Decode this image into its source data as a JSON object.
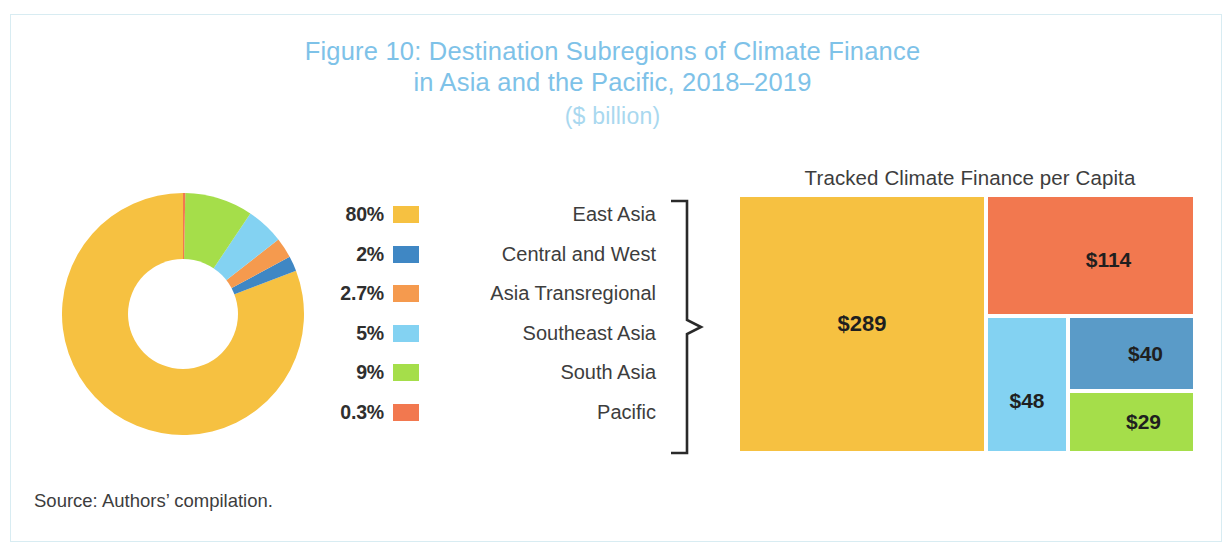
{
  "figure": {
    "title_line1": "Figure 10: Destination Subregions of Climate Finance",
    "title_line2": "in Asia and the Pacific, 2018–2019",
    "title_unit": "($ billion)",
    "source": "Source: Authors’ compilation."
  },
  "colors": {
    "title": "#7ec2e8",
    "title_unit": "#a9d8ef",
    "frame": "#d8ecf2",
    "east_asia": "#f6c141",
    "central_and_west": "#3f87c4",
    "asia_transregional": "#f59a4e",
    "southeast_asia": "#83d2f2",
    "south_asia": "#a5de4a",
    "pacific": "#f2784f",
    "brace": "#2a2a2a",
    "text": "#3d3d3d"
  },
  "legend": {
    "items": [
      {
        "pct": "80%",
        "label": "East Asia",
        "color": "#f6c141",
        "key": "east-asia"
      },
      {
        "pct": "2%",
        "label": "Central and West",
        "color": "#3f87c4",
        "key": "central-and-west"
      },
      {
        "pct": "2.7%",
        "label": "Asia Transregional",
        "color": "#f59a4e",
        "key": "asia-transregional"
      },
      {
        "pct": "5%",
        "label": "Southeast Asia",
        "color": "#83d2f2",
        "key": "southeast-asia"
      },
      {
        "pct": "9%",
        "label": "South Asia",
        "color": "#a5de4a",
        "key": "south-asia"
      },
      {
        "pct": "0.3%",
        "label": "Pacific",
        "color": "#f2784f",
        "key": "pacific"
      }
    ]
  },
  "treemap": {
    "title": "Tracked Climate Finance per Capita",
    "cells": [
      {
        "value": "$289",
        "label": "East Asia",
        "color": "#f6c141",
        "key": "east-asia"
      },
      {
        "value": "$114",
        "label": "Pacific",
        "color": "#f2784f",
        "key": "pacific"
      },
      {
        "value": "$48",
        "label": "Southeast Asia",
        "color": "#83d2f2",
        "key": "southeast-asia"
      },
      {
        "value": "$40",
        "label": "Central and West",
        "color": "#5a9bc8",
        "key": "central-and-west"
      },
      {
        "value": "$29",
        "label": "South Asia",
        "color": "#a5de4a",
        "key": "south-asia"
      }
    ]
  },
  "chart_data": [
    {
      "type": "pie",
      "title": "Destination Subregions of Climate Finance in Asia and the Pacific, 2018–2019",
      "subtitle": "($ billion)",
      "variant": "donut",
      "hole_ratio": 0.46,
      "unit": "percent of total",
      "legend_position": "right",
      "grid": false,
      "categories": [
        "East Asia",
        "Central and West",
        "Asia Transregional",
        "Southeast Asia",
        "South Asia",
        "Pacific"
      ],
      "labels": [
        "80%",
        "2%",
        "2.7%",
        "5%",
        "9%",
        "0.3%"
      ],
      "values": [
        80,
        2,
        2.7,
        5,
        9,
        0.3
      ],
      "colors": [
        "#f6c141",
        "#3f87c4",
        "#f59a4e",
        "#83d2f2",
        "#a5de4a",
        "#f2784f"
      ]
    },
    {
      "type": "treemap",
      "title": "Tracked Climate Finance per Capita",
      "xlabel": "",
      "ylabel": "",
      "grid": false,
      "legend_position": "none",
      "unit": "$ per capita",
      "categories": [
        "East Asia",
        "Pacific",
        "Southeast Asia",
        "Central and West",
        "South Asia"
      ],
      "labels": [
        "$289",
        "$114",
        "$48",
        "$40",
        "$29"
      ],
      "values": [
        289,
        114,
        48,
        40,
        29
      ],
      "colors": [
        "#f6c141",
        "#f2784f",
        "#83d2f2",
        "#5a9bc8",
        "#a5de4a"
      ]
    }
  ]
}
